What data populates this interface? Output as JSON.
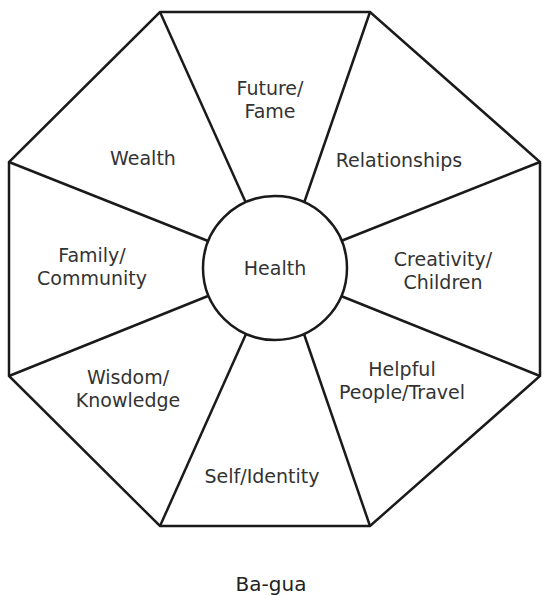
{
  "diagram": {
    "center": "Health",
    "sectors": [
      {
        "id": "future-fame",
        "line1": "Future/",
        "line2": "Fame"
      },
      {
        "id": "relationships",
        "line1": "Relationships",
        "line2": ""
      },
      {
        "id": "creativity-children",
        "line1": "Creativity/",
        "line2": "Children"
      },
      {
        "id": "helpful-people-travel",
        "line1": "Helpful",
        "line2": "People/Travel"
      },
      {
        "id": "self-identity",
        "line1": "Self/Identity",
        "line2": ""
      },
      {
        "id": "wisdom-knowledge",
        "line1": "Wisdom/",
        "line2": "Knowledge"
      },
      {
        "id": "family-community",
        "line1": "Family/",
        "line2": "Community"
      },
      {
        "id": "wealth",
        "line1": "Wealth",
        "line2": ""
      }
    ],
    "caption": "Ba-gua",
    "stroke_color": "#1a1a1a"
  }
}
